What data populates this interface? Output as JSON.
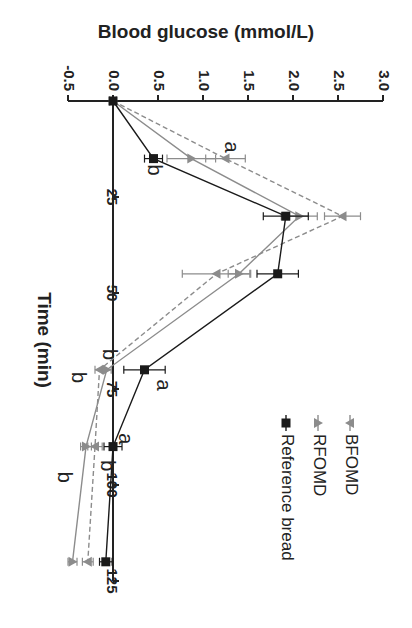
{
  "chart_data": {
    "type": "line",
    "orientation": "rotated-90-clockwise",
    "title": "",
    "xlabel": "Time (min)",
    "ylabel": "Blood glucose (mmol/L)",
    "x_ticks": [
      25,
      50,
      75,
      100,
      125
    ],
    "y_ticks": [
      "-0.5",
      "0.0",
      "0.5",
      "1.0",
      "1.5",
      "2.0",
      "2.5",
      "3.0"
    ],
    "xlim": [
      0,
      125
    ],
    "ylim": [
      -0.5,
      3.0
    ],
    "x": [
      0,
      15,
      30,
      45,
      70,
      90,
      120
    ],
    "series": [
      {
        "name": "BFOMD",
        "values": [
          0,
          1.25,
          2.55,
          1.15,
          -0.15,
          -0.2,
          -0.28
        ],
        "errors": [
          0,
          0.22,
          0.2,
          0.38,
          0.05,
          0.08,
          0.06
        ],
        "color": "#8c8c8c",
        "style": "dashed",
        "marker": "triangle-down"
      },
      {
        "name": "RFOMD",
        "values": [
          0,
          0.87,
          2.07,
          1.4,
          -0.07,
          -0.3,
          -0.45
        ],
        "errors": [
          0,
          0.27,
          0.2,
          0.12,
          0.05,
          0.06,
          0.05
        ],
        "color": "#8c8c8c",
        "style": "solid",
        "marker": "triangle-up"
      },
      {
        "name": "Reference bread",
        "values": [
          0,
          0.45,
          1.92,
          1.83,
          0.35,
          0.0,
          -0.08
        ],
        "errors": [
          0,
          0.1,
          0.25,
          0.23,
          0.23,
          0.1,
          0.07
        ],
        "color": "#1a1a1a",
        "style": "solid",
        "marker": "square"
      }
    ],
    "annotations": [
      {
        "text": "a",
        "x": 12,
        "y": 1.3
      },
      {
        "text": "b",
        "x": 18,
        "y": 0.45
      },
      {
        "text": "b",
        "x": 66,
        "y": -0.05
      },
      {
        "text": "b",
        "x": 72,
        "y": -0.4
      },
      {
        "text": "a",
        "x": 74,
        "y": 0.55
      },
      {
        "text": "b",
        "x": 95,
        "y": -0.07
      },
      {
        "text": "a",
        "x": 88,
        "y": 0.13
      },
      {
        "text": "b",
        "x": 98,
        "y": -0.55
      }
    ],
    "legend": [
      "BFOMD",
      "RFOMD",
      "Reference bread"
    ],
    "legend_position": "upper-right (in rotated view: lower-right)",
    "grid": false
  }
}
